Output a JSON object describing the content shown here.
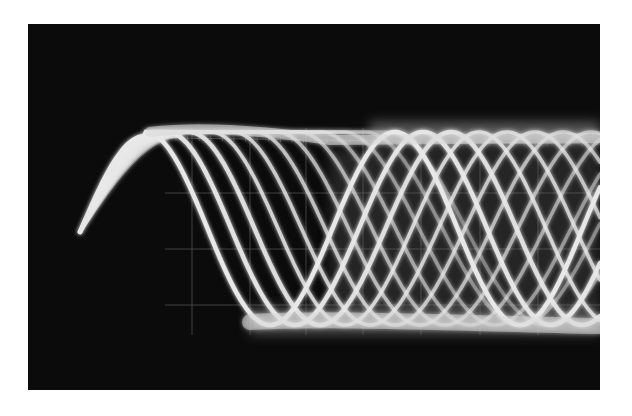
{
  "image": {
    "subject": "oscilloscope-trace-photograph",
    "description": "Multiple exposure oscilloscope display showing a damped/decaying sinusoidal step response; successive traces shift phase forming a crosshatched band",
    "colors": {
      "background": "#0b0b0b",
      "trace": "#e8e8e8",
      "graticule": "#5a5a5a",
      "page": "#ffffff"
    },
    "graticule": {
      "vertical_lines_x": [
        192,
        250,
        306,
        363,
        421,
        480,
        538
      ],
      "horizontal_lines_y": [
        138,
        193,
        249,
        305
      ]
    },
    "trace_count": 12
  }
}
